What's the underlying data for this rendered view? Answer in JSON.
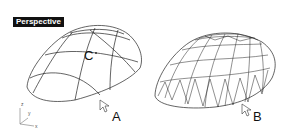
{
  "viewport": {
    "title": "Perspective"
  },
  "labels": {
    "surface_a": "A",
    "surface_b": "B",
    "point_c": "C"
  },
  "axes": {
    "z": "z",
    "y": "y",
    "x": "x"
  },
  "colors": {
    "background": "#ffffff",
    "wire": "#222222",
    "title_bg": "#111111",
    "title_fg": "#ffffff"
  }
}
